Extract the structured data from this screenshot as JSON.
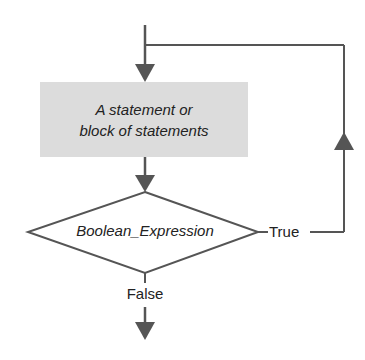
{
  "diagram": {
    "type": "flowchart",
    "nodes": {
      "statement_box": {
        "line1": "A statement or",
        "line2": "block of statements",
        "fill": "#dcdcdc"
      },
      "decision": {
        "label": "Boolean_Expression"
      }
    },
    "edges": {
      "true_label": "True",
      "false_label": "False"
    },
    "colors": {
      "line": "#555555",
      "text": "#222222"
    }
  }
}
